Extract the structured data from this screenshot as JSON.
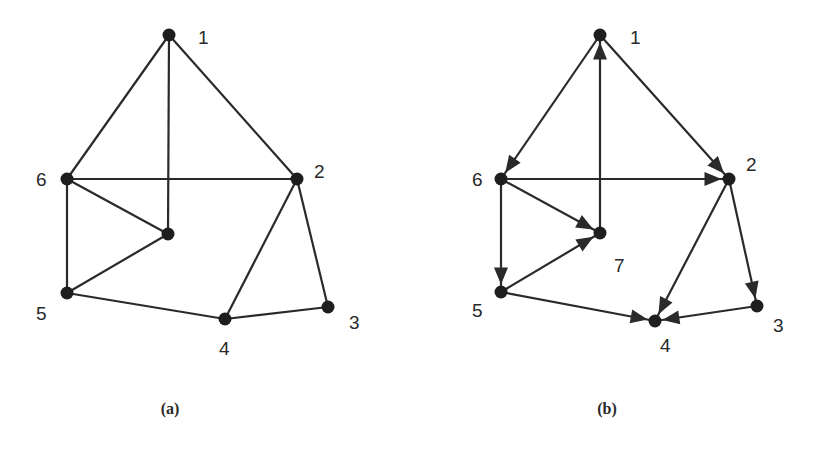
{
  "figure": {
    "panels": [
      {
        "id": "a",
        "caption": "(a)",
        "caption_pos": [
          170,
          414
        ],
        "directed": false,
        "nodes": [
          {
            "id": "1",
            "label": "1",
            "x": 169,
            "y": 35,
            "lx": 198,
            "ly": 44
          },
          {
            "id": "2",
            "label": "2",
            "x": 297,
            "y": 179,
            "lx": 314,
            "ly": 178
          },
          {
            "id": "3",
            "label": "3",
            "x": 328,
            "y": 307,
            "lx": 349,
            "ly": 329
          },
          {
            "id": "4",
            "label": "4",
            "x": 225,
            "y": 319,
            "lx": 219,
            "ly": 355
          },
          {
            "id": "5",
            "label": "5",
            "x": 67,
            "y": 293,
            "lx": 36,
            "ly": 320
          },
          {
            "id": "6",
            "label": "6",
            "x": 67,
            "y": 179,
            "lx": 36,
            "ly": 186
          },
          {
            "id": "7",
            "label": "",
            "x": 168,
            "y": 234,
            "lx": 0,
            "ly": 0
          }
        ],
        "edges": [
          [
            "1",
            "6"
          ],
          [
            "1",
            "7"
          ],
          [
            "1",
            "2"
          ],
          [
            "6",
            "2"
          ],
          [
            "6",
            "7"
          ],
          [
            "6",
            "5"
          ],
          [
            "5",
            "7"
          ],
          [
            "2",
            "4"
          ],
          [
            "2",
            "3"
          ],
          [
            "5",
            "4"
          ],
          [
            "4",
            "3"
          ]
        ]
      },
      {
        "id": "b",
        "caption": "(b)",
        "caption_pos": [
          607,
          414
        ],
        "directed": true,
        "nodes": [
          {
            "id": "1",
            "label": "1",
            "x": 600,
            "y": 35,
            "lx": 630,
            "ly": 44
          },
          {
            "id": "2",
            "label": "2",
            "x": 729,
            "y": 179,
            "lx": 746,
            "ly": 171
          },
          {
            "id": "3",
            "label": "3",
            "x": 757,
            "y": 306,
            "lx": 773,
            "ly": 332
          },
          {
            "id": "4",
            "label": "4",
            "x": 655,
            "y": 321,
            "lx": 660,
            "ly": 352
          },
          {
            "id": "5",
            "label": "5",
            "x": 501,
            "y": 292,
            "lx": 472,
            "ly": 317
          },
          {
            "id": "6",
            "label": "6",
            "x": 501,
            "y": 179,
            "lx": 472,
            "ly": 186
          },
          {
            "id": "7",
            "label": "7",
            "x": 600,
            "y": 233,
            "lx": 614,
            "ly": 272
          }
        ],
        "edges": [
          [
            "1",
            "6"
          ],
          [
            "7",
            "1"
          ],
          [
            "1",
            "2"
          ],
          [
            "6",
            "2"
          ],
          [
            "6",
            "7"
          ],
          [
            "6",
            "5"
          ],
          [
            "5",
            "7"
          ],
          [
            "2",
            "4"
          ],
          [
            "2",
            "3"
          ],
          [
            "5",
            "4"
          ],
          [
            "3",
            "4"
          ]
        ]
      }
    ],
    "colors": {
      "ink": "#2a2a2a",
      "node": "#1e1e1e",
      "background": "#ffffff"
    }
  }
}
